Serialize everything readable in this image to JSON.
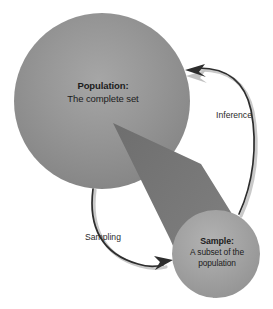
{
  "diagram": {
    "background_color": "#ffffff"
  },
  "population": {
    "title": "Population:",
    "subtitle": "The complete set",
    "shape": "circle",
    "fill_color": "#8a8a8a",
    "highlight_color": "#a8a8a8",
    "cx": 102,
    "cy": 101,
    "r": 88
  },
  "sample": {
    "title": "Sample:",
    "line1": "A subset of the",
    "line2": "population",
    "shape": "circle",
    "fill_color": "#9a9a9a",
    "highlight_color": "#b0b0b0",
    "cx": 216,
    "cy": 254,
    "r": 44
  },
  "cone": {
    "name": "sampling-cone",
    "fill_color": "#737373",
    "apex_x": 113,
    "apex_y": 123
  },
  "arrows": [
    {
      "id": "sampling-arrow",
      "label": "Sampling",
      "direction": "population-to-sample",
      "color": "#2d2d2d"
    },
    {
      "id": "inference-arrow",
      "label": "Inference",
      "direction": "sample-to-population",
      "color": "#2d2d2d"
    }
  ],
  "labels": {
    "sampling": "Sampling",
    "inference": "Inference"
  }
}
